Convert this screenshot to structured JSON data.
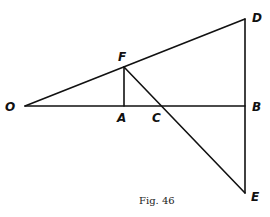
{
  "figure": {
    "caption": "Fig. 46",
    "points": {
      "O": {
        "label": "O",
        "x": 25,
        "y": 106
      },
      "A": {
        "label": "A",
        "x": 124,
        "y": 106
      },
      "C": {
        "label": "C",
        "x": 162,
        "y": 106
      },
      "B": {
        "label": "B",
        "x": 245,
        "y": 106
      },
      "F": {
        "label": "F",
        "x": 124,
        "y": 67
      },
      "D": {
        "label": "D",
        "x": 245,
        "y": 19
      },
      "E": {
        "label": "E",
        "x": 245,
        "y": 193
      }
    },
    "segments": [
      "O-B",
      "O-D",
      "D-E",
      "F-A",
      "F-E"
    ],
    "line_color": "#111111"
  }
}
